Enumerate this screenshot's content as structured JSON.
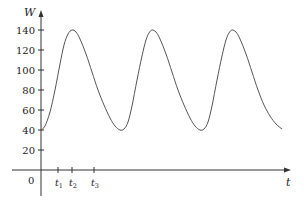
{
  "chart_data": {
    "type": "line",
    "title": "",
    "xlabel": "t",
    "ylabel": "W",
    "ylim": [
      0,
      150
    ],
    "y_ticks": [
      20,
      40,
      60,
      80,
      100,
      120,
      140
    ],
    "origin_label": "0",
    "x_ticks": [
      {
        "label": "t",
        "sub": "1",
        "px": 58
      },
      {
        "label": "t",
        "sub": "2",
        "px": 72
      },
      {
        "label": "t",
        "sub": "3",
        "px": 94
      }
    ],
    "series": [
      {
        "name": "W(t)",
        "description": "Periodic curve oscillating between minimum 40 and maximum 140, three peaks",
        "points_px": [
          [
            41,
            130
          ],
          [
            45,
            126
          ],
          [
            50,
            112
          ],
          [
            55,
            90
          ],
          [
            60,
            64
          ],
          [
            64,
            45
          ],
          [
            68,
            34
          ],
          [
            72,
            30
          ],
          [
            76,
            32
          ],
          [
            80,
            39
          ],
          [
            86,
            54
          ],
          [
            92,
            72
          ],
          [
            98,
            90
          ],
          [
            104,
            105
          ],
          [
            110,
            118
          ],
          [
            115,
            126
          ],
          [
            120,
            130
          ],
          [
            124,
            129
          ],
          [
            128,
            122
          ],
          [
            132,
            106
          ],
          [
            137,
            80
          ],
          [
            142,
            56
          ],
          [
            146,
            40
          ],
          [
            149,
            33
          ],
          [
            152,
            30
          ],
          [
            156,
            32
          ],
          [
            160,
            39
          ],
          [
            166,
            54
          ],
          [
            172,
            72
          ],
          [
            178,
            90
          ],
          [
            184,
            105
          ],
          [
            190,
            118
          ],
          [
            195,
            126
          ],
          [
            200,
            130
          ],
          [
            204,
            129
          ],
          [
            208,
            122
          ],
          [
            212,
            106
          ],
          [
            217,
            80
          ],
          [
            222,
            56
          ],
          [
            226,
            40
          ],
          [
            229,
            33
          ],
          [
            232,
            30
          ],
          [
            236,
            32
          ],
          [
            240,
            39
          ],
          [
            246,
            54
          ],
          [
            252,
            72
          ],
          [
            258,
            90
          ],
          [
            264,
            105
          ],
          [
            270,
            116
          ],
          [
            276,
            124
          ],
          [
            282,
            129
          ]
        ],
        "approx_values": {
          "start": 40,
          "peaks": [
            140,
            140,
            140
          ],
          "minima": [
            40,
            40
          ],
          "end": 40
        }
      }
    ],
    "grid": false,
    "legend": null
  },
  "axes": {
    "x_title": "t",
    "y_title": "W",
    "origin": "0",
    "y_tick_labels": [
      "140",
      "120",
      "100",
      "80",
      "60",
      "40",
      "20"
    ]
  }
}
